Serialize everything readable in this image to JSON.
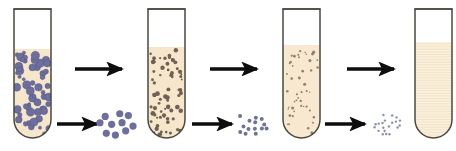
{
  "figure": {
    "background_color": "#ffffff",
    "canvas": {
      "width": 456,
      "height": 151
    }
  },
  "palette": {
    "tube_outline": "#4a4a42",
    "tube_outline_light": "#8a8274",
    "tube_empty_fill": "#ffffff",
    "suspension_fill_1": "#f6e6cc",
    "suspension_fill_2": "#f6e6cc",
    "suspension_fill_3": "#f7e8cf",
    "suspension_fill_4": "#fbf0dc",
    "particle_large": "#6b6e9e",
    "particle_large_edge": "#53567f",
    "particle_medium": "#6e6352",
    "particle_small": "#7c7260",
    "pellet_large": "#6b6e9e",
    "pellet_medium": "#6f7398",
    "pellet_small": "#8d90ad",
    "arrow_color": "#0d0d0d",
    "band_line": "#efdfc2"
  },
  "tubes": [
    {
      "id": "tube-1",
      "label": "Tube 1 — whole homogenate, large particles",
      "x": 14,
      "y": 9,
      "width": 37,
      "height": 129,
      "liquid_top": 40,
      "fill": "#f6e6cc",
      "particle_kind": "large",
      "particle_color": "#6b6e9e",
      "particle_count": 58,
      "particle_radius_min": 1.4,
      "particle_radius_max": 4.3,
      "banded": false
    },
    {
      "id": "tube-2",
      "label": "Tube 2 — supernatant after first spin",
      "x": 148,
      "y": 9,
      "width": 37,
      "height": 129,
      "liquid_top": 38,
      "fill": "#f6e6cc",
      "particle_kind": "medium",
      "particle_color": "#6e6352",
      "particle_count": 72,
      "particle_radius_min": 0.9,
      "particle_radius_max": 2.4,
      "banded": false
    },
    {
      "id": "tube-3",
      "label": "Tube 3 — supernatant after second spin",
      "x": 283,
      "y": 9,
      "width": 37,
      "height": 129,
      "liquid_top": 36,
      "fill": "#f7e8cf",
      "particle_kind": "small",
      "particle_color": "#7c7260",
      "particle_count": 48,
      "particle_radius_min": 0.7,
      "particle_radius_max": 1.6,
      "banded": false
    },
    {
      "id": "tube-4",
      "label": "Tube 4 — clear final supernatant",
      "x": 415,
      "y": 9,
      "width": 37,
      "height": 129,
      "liquid_top": 33,
      "fill": "#fbf0dc",
      "particle_kind": "none",
      "particle_color": "#fbf0dc",
      "particle_count": 0,
      "particle_radius_min": 0,
      "particle_radius_max": 0,
      "banded": true
    }
  ],
  "arrows": {
    "top_row": [
      {
        "id": "arrow-top-1",
        "x1": 75,
        "y1": 69,
        "x2": 122,
        "y2": 69
      },
      {
        "id": "arrow-top-2",
        "x1": 210,
        "y1": 69,
        "x2": 257,
        "y2": 69
      },
      {
        "id": "arrow-top-3",
        "x1": 347,
        "y1": 69,
        "x2": 394,
        "y2": 69
      }
    ],
    "bottom_row": [
      {
        "id": "arrow-bottom-1",
        "x1": 57,
        "y1": 124,
        "x2": 97,
        "y2": 124
      },
      {
        "id": "arrow-bottom-2",
        "x1": 192,
        "y1": 124,
        "x2": 232,
        "y2": 124
      },
      {
        "id": "arrow-bottom-3",
        "x1": 325,
        "y1": 124,
        "x2": 365,
        "y2": 124
      }
    ]
  },
  "pellets": [
    {
      "id": "pellet-1",
      "label": "Pellet 1 — large particles",
      "cx": 117,
      "cy": 124,
      "color": "#6b6e9e",
      "count": 10,
      "radius": 3.6,
      "spread_x": 18,
      "spread_y": 13
    },
    {
      "id": "pellet-2",
      "label": "Pellet 2 — medium particles",
      "cx": 252,
      "cy": 124,
      "color": "#6f7398",
      "count": 14,
      "radius": 2.0,
      "spread_x": 16,
      "spread_y": 12
    },
    {
      "id": "pellet-3",
      "label": "Pellet 3 — small particles",
      "cx": 387,
      "cy": 124,
      "color": "#8d90ad",
      "count": 20,
      "radius": 1.2,
      "spread_x": 14,
      "spread_y": 11
    }
  ]
}
